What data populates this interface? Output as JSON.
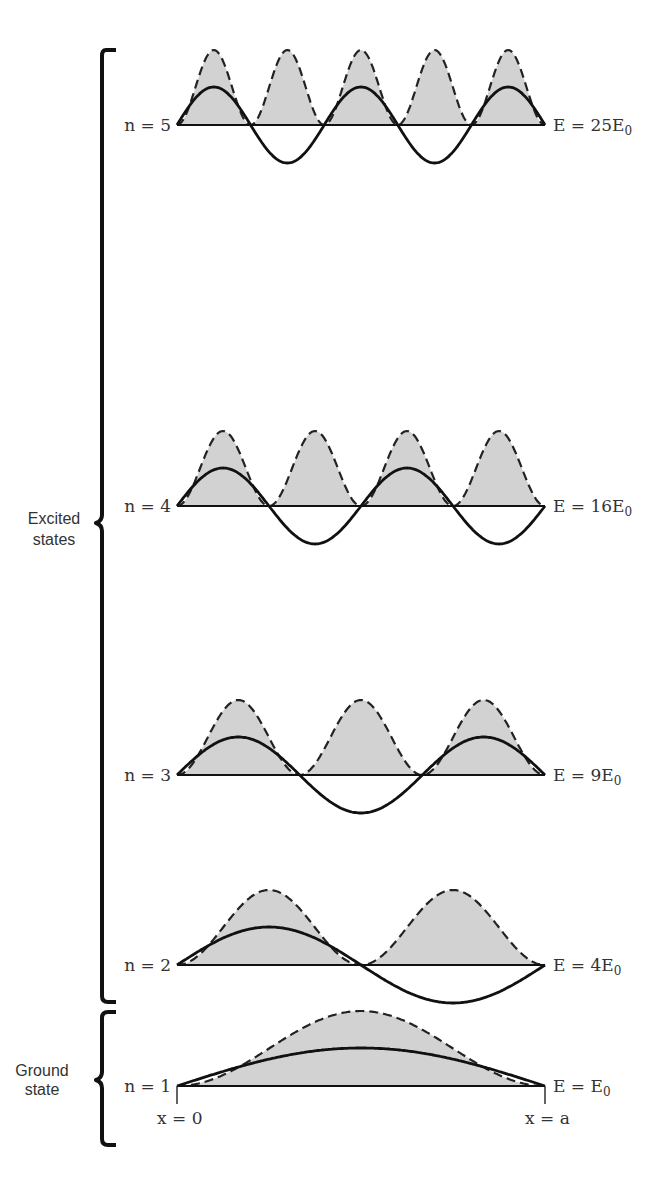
{
  "figure": {
    "groups": {
      "excited": {
        "label_line1": "Excited",
        "label_line2": "states"
      },
      "ground": {
        "label_line1": "Ground",
        "label_line2": "state"
      }
    },
    "x_labels": {
      "left": "x = 0",
      "right": "x = a"
    },
    "levels": [
      {
        "n": 5,
        "n_label": "n = 5",
        "energy_label": "E = 25E",
        "energy_sub": "0",
        "energy_multiplier": 25
      },
      {
        "n": 4,
        "n_label": "n = 4",
        "energy_label": "E = 16E",
        "energy_sub": "0",
        "energy_multiplier": 16
      },
      {
        "n": 3,
        "n_label": "n = 3",
        "energy_label": "E = 9E",
        "energy_sub": "0",
        "energy_multiplier": 9
      },
      {
        "n": 2,
        "n_label": "n = 2",
        "energy_label": "E = 4E",
        "energy_sub": "0",
        "energy_multiplier": 4
      },
      {
        "n": 1,
        "n_label": "n = 1",
        "energy_label": "E = E",
        "energy_sub": "0",
        "energy_multiplier": 1
      }
    ]
  },
  "colors": {
    "shade": "#d2d2d2",
    "line": "#111111",
    "text": "#333333",
    "background": "#ffffff"
  }
}
